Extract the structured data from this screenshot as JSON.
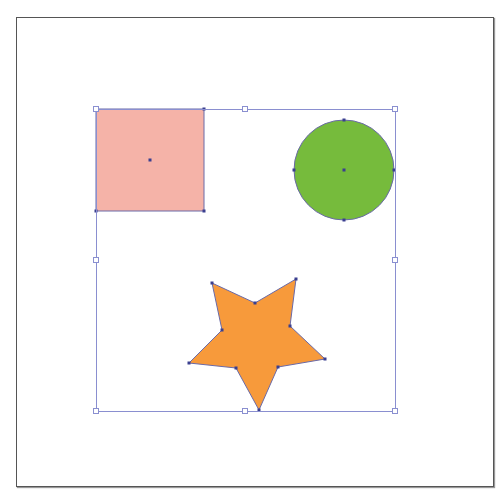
{
  "canvas": {
    "artboard": {
      "x": 16,
      "y": 17,
      "width": 476,
      "height": 468
    },
    "selection": {
      "x": 96,
      "y": 109,
      "width": 299,
      "height": 302,
      "stroke": "#8a8fd0",
      "handles": [
        [
          96,
          109
        ],
        [
          245,
          109
        ],
        [
          395,
          109
        ],
        [
          96,
          260
        ],
        [
          395,
          260
        ],
        [
          96,
          411
        ],
        [
          245,
          411
        ],
        [
          395,
          411
        ]
      ]
    },
    "shapes": {
      "square": {
        "name": "Rectangle",
        "x": 96,
        "y": 109,
        "width": 108,
        "height": 102,
        "fill": "#f5b3a8",
        "stroke": "#6a6aa8",
        "center": [
          150,
          160
        ],
        "anchors": [
          [
            96,
            109
          ],
          [
            204,
            109
          ],
          [
            204,
            211
          ],
          [
            96,
            211
          ]
        ]
      },
      "circle": {
        "name": "Ellipse",
        "cx": 344,
        "cy": 170,
        "r": 50,
        "fill": "#76bb3c",
        "stroke": "#6a6aa8",
        "anchors": [
          [
            344,
            120
          ],
          [
            394,
            170
          ],
          [
            344,
            220
          ],
          [
            294,
            170
          ]
        ]
      },
      "star": {
        "name": "Star",
        "fill": "#f79a3b",
        "stroke": "#6a6aa8",
        "points": [
          [
            212,
            283
          ],
          [
            255,
            303
          ],
          [
            296,
            279
          ],
          [
            290,
            326
          ],
          [
            325,
            359
          ],
          [
            278,
            367
          ],
          [
            259,
            410
          ],
          [
            236,
            368
          ],
          [
            189,
            363
          ],
          [
            222,
            330
          ]
        ]
      }
    },
    "anchor_color": "#3a3f8f"
  }
}
